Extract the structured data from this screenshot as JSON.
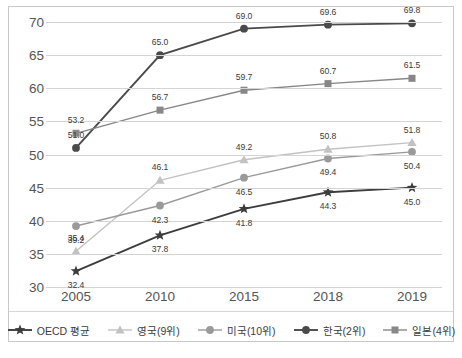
{
  "chart_data": {
    "type": "line",
    "title": "",
    "xlabel": "",
    "ylabel": "",
    "categories": [
      "2005",
      "2010",
      "2015",
      "2018",
      "2019"
    ],
    "ylim": [
      30,
      70
    ],
    "yticks": [
      30,
      35,
      40,
      45,
      50,
      55,
      60,
      65,
      70
    ],
    "grid": true,
    "legend_position": "bottom",
    "series": [
      {
        "name": "OECD 평균",
        "marker": "star",
        "color": "#3d3d3d",
        "values": [
          32.4,
          37.8,
          41.8,
          44.3,
          45.0
        ],
        "labels": [
          "32.4",
          "37.8",
          "41.8",
          "44.3",
          "45.0"
        ]
      },
      {
        "name": "영국(9위)",
        "marker": "triangle",
        "color": "#c2c2c2",
        "values": [
          35.4,
          46.1,
          49.2,
          50.8,
          51.8
        ],
        "labels": [
          "35.4",
          "46.1",
          "49.2",
          "50.8",
          "51.8"
        ]
      },
      {
        "name": "미국(10위)",
        "marker": "circle",
        "color": "#9a9a9a",
        "values": [
          39.2,
          42.3,
          46.5,
          49.4,
          50.4
        ],
        "labels": [
          "39.2",
          "42.3",
          "46.5",
          "49.4",
          "50.4"
        ]
      },
      {
        "name": "한국(2위)",
        "marker": "circle",
        "color": "#4a4a4a",
        "values": [
          51.0,
          65.0,
          69.0,
          69.6,
          69.8
        ],
        "labels": [
          "51.0",
          "65.0",
          "69.0",
          "69.6",
          "69.8"
        ]
      },
      {
        "name": "일본(4위)",
        "marker": "square",
        "color": "#878787",
        "values": [
          53.2,
          56.7,
          59.7,
          60.7,
          61.5
        ],
        "labels": [
          "53.2",
          "56.7",
          "59.7",
          "60.7",
          "61.5"
        ]
      }
    ],
    "point_label_offsets": [
      [
        [
          0,
          14
        ],
        [
          0,
          14
        ],
        [
          0,
          14
        ],
        [
          0,
          14
        ],
        [
          0,
          14
        ]
      ],
      [
        [
          0,
          -13
        ],
        [
          0,
          -13
        ],
        [
          0,
          -13
        ],
        [
          0,
          -13
        ],
        [
          0,
          -13
        ]
      ],
      [
        [
          0,
          14
        ],
        [
          0,
          14
        ],
        [
          0,
          14
        ],
        [
          0,
          14
        ],
        [
          0,
          14
        ]
      ],
      [
        [
          0,
          -13
        ],
        [
          0,
          -13
        ],
        [
          0,
          -13
        ],
        [
          0,
          -13
        ],
        [
          0,
          -13
        ]
      ],
      [
        [
          0,
          -13
        ],
        [
          0,
          -13
        ],
        [
          0,
          -13
        ],
        [
          0,
          -13
        ],
        [
          0,
          -13
        ]
      ]
    ]
  }
}
